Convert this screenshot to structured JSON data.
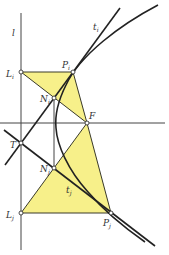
{
  "figure": {
    "colors": {
      "line": "#2a2a2a",
      "fill": "#f7f08a",
      "fill_stroke": "#3a3a2a",
      "point_fill": "#ffffff"
    },
    "labels": {
      "directrix": {
        "main": "l",
        "sub": ""
      },
      "tangent_i": {
        "main": "t",
        "sub": "i"
      },
      "tangent_j": {
        "main": "t",
        "sub": "j"
      },
      "point_Li": {
        "main": "L",
        "sub": "i"
      },
      "point_Pi": {
        "main": "P",
        "sub": "i"
      },
      "point_Ni": {
        "main": "N",
        "sub": "i"
      },
      "point_F": {
        "main": "F",
        "sub": ""
      },
      "point_T": {
        "main": "T",
        "sub": ""
      },
      "point_Nj": {
        "main": "N",
        "sub": "j"
      },
      "point_Lj": {
        "main": "L",
        "sub": "j"
      },
      "point_Pj": {
        "main": "P",
        "sub": "j"
      }
    }
  }
}
